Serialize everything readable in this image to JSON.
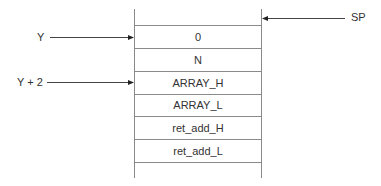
{
  "diagram": {
    "type": "stack-frame",
    "cells": [
      {
        "label": ""
      },
      {
        "label": "0"
      },
      {
        "label": "N"
      },
      {
        "label": "ARRAY_H"
      },
      {
        "label": "ARRAY_L"
      },
      {
        "label": "ret_add_H"
      },
      {
        "label": "ret_add_L"
      },
      {
        "label": ""
      }
    ],
    "pointers": {
      "sp": {
        "label": "SP",
        "points_to": "top of stack"
      },
      "y": {
        "label": "Y",
        "points_to": "0"
      },
      "y2": {
        "label": "Y + 2",
        "points_to": "ARRAY_H"
      }
    },
    "line_color": "#888888",
    "arrow_color": "#333333"
  }
}
